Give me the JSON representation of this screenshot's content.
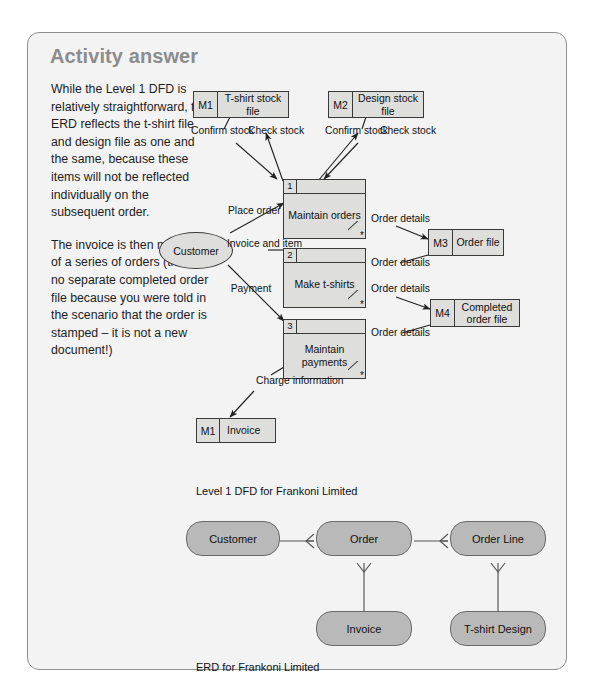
{
  "panel": {
    "title": "Activity answer",
    "background_color": "#f3f3f3",
    "border_color": "#8f8f8f",
    "title_color": "#8c8c8c"
  },
  "prose": {
    "paragraph_1": "While the Level 1 DFD is relatively straightforward, the ERD reflects the t-shirt file and design file as one and the same, because these items will not be reflected individually on the subsequent order.",
    "paragraph_2": "The invoice is then made up of a series of orders (there is no separate completed order file because you were told in the scenario that the order is stamped – it is not a new document!)"
  },
  "dfd": {
    "caption": "Level 1 DFD for Frankoni Limited",
    "datastores": [
      {
        "id": "M1",
        "name": "T-shirt stock file"
      },
      {
        "id": "M2",
        "name": "Design stock file"
      },
      {
        "id": "M3",
        "name": "Order file"
      },
      {
        "id": "M4",
        "name": "Completed order file"
      },
      {
        "id": "M1",
        "name": "Invoice"
      }
    ],
    "processes": [
      {
        "number": "1",
        "name": "Maintain orders",
        "marker": "*"
      },
      {
        "number": "2",
        "name": "Make t-shirts",
        "marker": "*"
      },
      {
        "number": "3",
        "name": "Maintain payments",
        "marker": "*"
      }
    ],
    "external_entities": [
      {
        "name": "Customer"
      }
    ],
    "flows": [
      {
        "label": "Confirm stock"
      },
      {
        "label": "Check stock"
      },
      {
        "label": "Confirm stock"
      },
      {
        "label": "Check stock"
      },
      {
        "label": "Place order"
      },
      {
        "label": "Invoice and item"
      },
      {
        "label": "Payment"
      },
      {
        "label": "Order details"
      },
      {
        "label": "Order details"
      },
      {
        "label": "Order details"
      },
      {
        "label": "Order details"
      },
      {
        "label": "Charge information"
      }
    ],
    "flow_labels": {
      "confirm_stock_left": "Confirm stock",
      "check_stock_left": "Check stock",
      "confirm_stock_right": "Confirm stock",
      "check_stock_right": "Check stock",
      "place_order": "Place order",
      "invoice_and_item": "Invoice and item",
      "payment": "Payment",
      "order_details_1": "Order details",
      "order_details_2": "Order details",
      "order_details_3": "Order details",
      "order_details_4": "Order details",
      "charge_information": "Charge information"
    },
    "datastore_labels": {
      "m1_id": "M1",
      "m1_name": "T-shirt stock file",
      "m2_id": "M2",
      "m2_name": "Design stock file",
      "m3_id": "M3",
      "m3_name": "Order file",
      "m4_id": "M4",
      "m4_name": "Completed order file",
      "m1b_id": "M1",
      "m1b_name": "Invoice"
    },
    "process_labels": {
      "p1_num": "1",
      "p1_name": "Maintain orders",
      "p1_star": "*",
      "p2_num": "2",
      "p2_name": "Make t-shirts",
      "p2_star": "*",
      "p3_num": "3",
      "p3_name": "Maintain payments",
      "p3_star": "*"
    },
    "entity_labels": {
      "customer": "Customer"
    }
  },
  "erd": {
    "caption": "ERD for Frankoni Limited",
    "entities": [
      {
        "name": "Customer"
      },
      {
        "name": "Order"
      },
      {
        "name": "Order Line"
      },
      {
        "name": "Invoice"
      },
      {
        "name": "T-shirt Design"
      }
    ],
    "entity_labels": {
      "customer": "Customer",
      "order": "Order",
      "order_line": "Order Line",
      "invoice": "Invoice",
      "tshirt_design": "T-shirt Design"
    },
    "relationships": [
      {
        "from": "Customer",
        "to": "Order",
        "cardinality": "one-to-many"
      },
      {
        "from": "Order",
        "to": "Order Line",
        "cardinality": "one-to-many"
      },
      {
        "from": "Order",
        "to": "Invoice",
        "cardinality": "one-to-many"
      },
      {
        "from": "Order Line",
        "to": "T-shirt Design",
        "cardinality": "one-to-many"
      }
    ],
    "box_color": "#b9b9b9",
    "box_border_color": "#6a6a6a"
  }
}
